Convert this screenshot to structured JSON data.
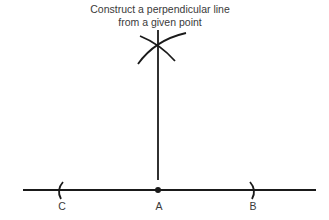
{
  "title": {
    "line1": "Construct a perpendicular line",
    "line2": "from a given point"
  },
  "points": {
    "c": "C",
    "a": "A",
    "b": "B"
  },
  "colors": {
    "stroke": "#1a1a1a",
    "text": "#3a3a3a"
  }
}
